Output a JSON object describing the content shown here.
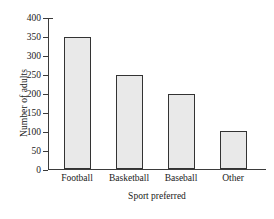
{
  "chart_data": {
    "type": "bar",
    "title": "",
    "categories": [
      "Football",
      "Basketball",
      "Baseball",
      "Other"
    ],
    "values": [
      350,
      250,
      200,
      100
    ],
    "xlabel": "Sport preferred",
    "ylabel": "Number of adults",
    "ylim": [
      0,
      400
    ],
    "ytick_step": 50,
    "yticks": [
      0,
      50,
      100,
      150,
      200,
      250,
      300,
      350,
      400
    ],
    "ytick_labels": [
      "0",
      "50",
      "100",
      "150",
      "200",
      "250",
      "300",
      "350",
      "400"
    ],
    "grid": false,
    "legend": null,
    "bar_fill_color": "#e9e9e9",
    "bar_edge_color": "#333333",
    "axis_color": "#3b3b3b",
    "background_color": "#ffffff"
  }
}
